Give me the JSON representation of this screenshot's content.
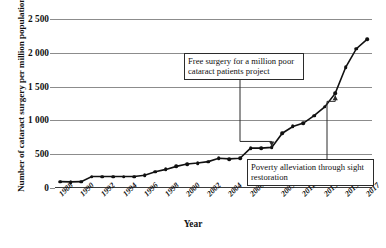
{
  "chart_data": {
    "type": "line",
    "title": "",
    "xlabel": "Year",
    "ylabel": "Number of cataract surgery per million population",
    "ylim": [
      0,
      2500
    ],
    "yticks": [
      "0",
      "500",
      "1 000",
      "1 500",
      "2 000",
      "2 500"
    ],
    "ytick_values": [
      0,
      500,
      1000,
      1500,
      2000,
      2500
    ],
    "grid": true,
    "legend": "none",
    "categories": [
      "1988",
      "1989",
      "1990",
      "1991",
      "1992",
      "1993",
      "1994",
      "1995",
      "1996",
      "1997",
      "1998",
      "1999",
      "2000",
      "2001",
      "2002",
      "2003",
      "2004",
      "2005",
      "2006",
      "2007",
      "2008",
      "2009",
      "2010",
      "2011",
      "2012",
      "2013",
      "2014",
      "2015",
      "2016",
      "2017"
    ],
    "xtick_labels": [
      "1988",
      "1990",
      "1992",
      "1994",
      "1996",
      "1998",
      "2000",
      "2002",
      "2004",
      "2006",
      "2009",
      "2011",
      "2013",
      "2015",
      "2017"
    ],
    "values": [
      95,
      90,
      95,
      170,
      170,
      170,
      170,
      170,
      190,
      240,
      275,
      320,
      355,
      370,
      390,
      440,
      430,
      440,
      590,
      590,
      600,
      810,
      910,
      960,
      1070,
      1200,
      1400,
      1790,
      2060,
      2200
    ],
    "annotations": [
      {
        "text": "Free surgery for a million poor cataract patients project",
        "target_year": "2008",
        "target_value": 600,
        "arrow": "down"
      },
      {
        "text": "Poverty alleviation through sight restoration",
        "target_year": "2014",
        "target_value": 1400,
        "arrow": "up"
      }
    ],
    "colors": {
      "line": "#111111",
      "marker": "#111111",
      "grid": "#8c8c8c",
      "axis": "#3a3a3a",
      "box_border": "#2b2b2b"
    }
  },
  "caption": ""
}
